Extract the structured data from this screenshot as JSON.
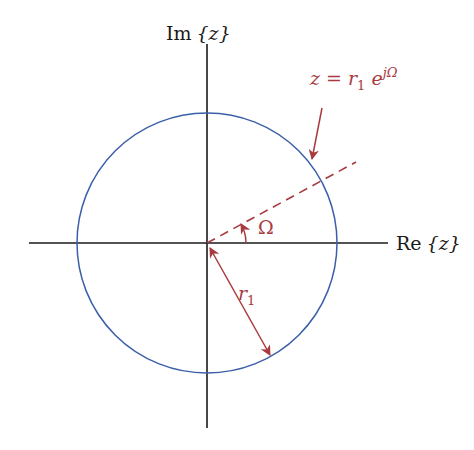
{
  "diagram": {
    "axes": {
      "imag_label_prefix": "Im",
      "imag_label_var": "{z}",
      "real_label_prefix": "Re",
      "real_label_var": "{z}"
    },
    "point_label": {
      "lhs": "z = r",
      "sub": "1",
      "base": " e",
      "sup": "jΩ"
    },
    "angle_label": "Ω",
    "radius_label": {
      "base": "r",
      "sub": "1"
    },
    "colors": {
      "axis": "#1a1a1a",
      "circle": "#3b5fa8",
      "accent": "#a83a3f"
    }
  }
}
